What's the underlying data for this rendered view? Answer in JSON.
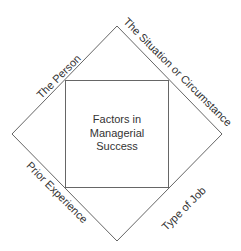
{
  "diagram": {
    "center": {
      "lines": [
        "Factors in",
        "Managerial",
        "Success"
      ]
    },
    "sides": {
      "top_left": "The Person",
      "top_right": "The Situation or Circumstance",
      "bottom_left": "Prior Experience",
      "bottom_right": "Type of Job"
    },
    "colors": {
      "line": "#666666",
      "text": "#333333",
      "background": "#ffffff"
    }
  }
}
